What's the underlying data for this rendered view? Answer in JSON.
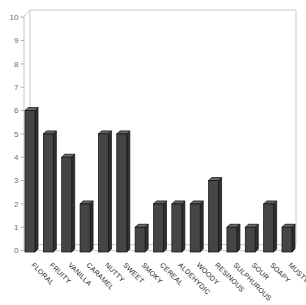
{
  "chart": {
    "background": "#ffffff",
    "frame_color": "#c9c9c9",
    "tick_color": "#b3b3b3",
    "y_label_color": "#6e6e6e",
    "x_label_color": "#1a1a1a",
    "bar_front_color": "#454545",
    "bar_side_color": "#303030",
    "bar_top_color": "#666666",
    "bar_outline_color": "#141414"
  },
  "chart_data": {
    "type": "bar",
    "style": "3d-column",
    "title": "",
    "xlabel": "",
    "ylabel": "",
    "categories": [
      "FLORAL",
      "FRUITY",
      "VANILLA",
      "CARAMEL",
      "NUTTY",
      "SWEET",
      "SMOKY",
      "CEREAL",
      "ALDEHYDIC",
      "WOODY",
      "RESINOUS",
      "SULPHUROUS",
      "SOUR",
      "SOAPY",
      "MUSTY"
    ],
    "values": [
      6,
      5,
      4,
      2,
      5,
      5,
      1,
      2,
      2,
      2,
      3,
      1,
      1,
      2,
      1
    ],
    "ylim": [
      0,
      10
    ],
    "ytick_step": 1,
    "yticks": [
      0,
      1,
      2,
      3,
      4,
      5,
      6,
      7,
      8,
      9,
      10
    ],
    "grid": false,
    "legend": false
  }
}
